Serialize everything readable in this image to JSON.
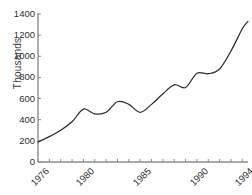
{
  "chart_data": {
    "type": "line",
    "title": "",
    "xlabel": "",
    "ylabel": "Thousands",
    "xlim": [
      1976,
      1994.5
    ],
    "ylim": [
      0,
      1400
    ],
    "grid": false,
    "legend": false,
    "y_ticks": [
      0,
      200,
      400,
      600,
      800,
      1000,
      1200,
      1400
    ],
    "y_tick_labels": [
      "0",
      "200",
      "400",
      "600",
      "800",
      "1000",
      "1200",
      "1400"
    ],
    "x_ticks": [
      1976,
      1977,
      1978,
      1979,
      1980,
      1981,
      1982,
      1983,
      1984,
      1985,
      1986,
      1987,
      1988,
      1989,
      1990,
      1991,
      1992,
      1993,
      1994
    ],
    "x_tick_labels_shown": [
      "1976",
      "1980",
      "1985",
      "1990",
      "1994"
    ],
    "x_tick_label_years": [
      1976,
      1980,
      1985,
      1990,
      1994
    ],
    "line_color": "#2b2b2b",
    "axis_color": "#8c8c8c",
    "background_color": "#ffffff",
    "series": [
      {
        "name": "Thousands",
        "x": [
          1976,
          1977,
          1978,
          1979,
          1980,
          1981,
          1982,
          1983,
          1984,
          1985,
          1986,
          1987,
          1988,
          1989,
          1990,
          1991,
          1992,
          1993,
          1994,
          1994.5
        ],
        "values": [
          190,
          240,
          300,
          380,
          500,
          455,
          470,
          570,
          545,
          470,
          545,
          645,
          730,
          705,
          840,
          835,
          880,
          1050,
          1260,
          1330
        ]
      }
    ]
  },
  "axis": {
    "y_title": "Thousands"
  }
}
